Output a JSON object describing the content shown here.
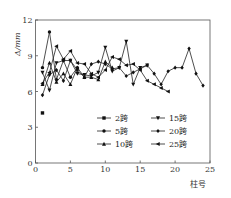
{
  "chart_data": {
    "type": "line",
    "title": "",
    "xlabel": "柱号",
    "ylabel": "Δ/mm",
    "xlim": [
      0,
      25
    ],
    "ylim": [
      0,
      12
    ],
    "xticks": [
      0,
      5,
      10,
      15,
      20,
      25
    ],
    "yticks": [
      0,
      3,
      6,
      9,
      12
    ],
    "grid": false,
    "legend_position": "inside lower right",
    "series": [
      {
        "name": "2跨",
        "marker": "square",
        "x": [
          1
        ],
        "y": [
          4.2
        ]
      },
      {
        "name": "5跨",
        "marker": "circle",
        "x": [
          1,
          2,
          3,
          4,
          5,
          6
        ],
        "y": [
          8.0,
          11.0,
          7.0,
          8.6,
          7.2,
          8.0
        ]
      },
      {
        "name": "10跨",
        "marker": "triangle-up",
        "x": [
          1,
          2,
          3,
          4,
          5,
          6,
          7,
          8,
          9,
          10,
          11
        ],
        "y": [
          6.6,
          8.4,
          6.8,
          7.5,
          6.6,
          8.0,
          7.2,
          7.2,
          7.0,
          8.5,
          8.0
        ]
      },
      {
        "name": "15跨",
        "marker": "triangle-down",
        "x": [
          1,
          2,
          3,
          4,
          5,
          6,
          7,
          8,
          9,
          10,
          11,
          12,
          13,
          14,
          15,
          16
        ],
        "y": [
          7.6,
          6.1,
          8.4,
          8.6,
          8.6,
          7.5,
          7.4,
          7.3,
          7.6,
          9.7,
          7.7,
          8.0,
          10.2,
          6.6,
          8.0,
          8.2
        ]
      },
      {
        "name": "20跨",
        "marker": "diamond",
        "x": [
          1,
          2,
          3,
          4,
          5,
          6,
          7,
          8,
          9,
          10,
          11,
          12,
          13,
          14,
          15,
          16,
          17,
          18,
          19,
          20,
          21,
          22,
          23,
          24
        ],
        "y": [
          5.7,
          7.4,
          7.8,
          6.9,
          8.6,
          7.8,
          7.2,
          8.3,
          8.5,
          8.3,
          7.9,
          8.0,
          7.3,
          7.6,
          7.9,
          8.2,
          7.5,
          6.6,
          7.7,
          8.0,
          8.0,
          9.6,
          7.5,
          6.5
        ]
      },
      {
        "name": "25跨",
        "marker": "triangle-left",
        "x": [
          1,
          2,
          3,
          4,
          5,
          6,
          7,
          8,
          9,
          10,
          11,
          12,
          13,
          14,
          15,
          16,
          17,
          18,
          19
        ],
        "y": [
          6.7,
          7.6,
          9.8,
          8.7,
          9.4,
          8.4,
          8.3,
          7.5,
          7.2,
          7.8,
          8.9,
          8.7,
          8.2,
          8.3,
          7.8,
          6.9,
          6.6,
          6.3,
          6.0
        ]
      }
    ]
  },
  "legend": {
    "items": [
      {
        "label": "2跨",
        "marker": "square"
      },
      {
        "label": "5跨",
        "marker": "circle"
      },
      {
        "label": "10跨",
        "marker": "triangle-up"
      },
      {
        "label": "15跨",
        "marker": "triangle-down"
      },
      {
        "label": "20跨",
        "marker": "diamond"
      },
      {
        "label": "25跨",
        "marker": "triangle-left"
      }
    ]
  },
  "axes": {
    "xlabel": "柱号",
    "ylabel": "Δ/mm"
  }
}
